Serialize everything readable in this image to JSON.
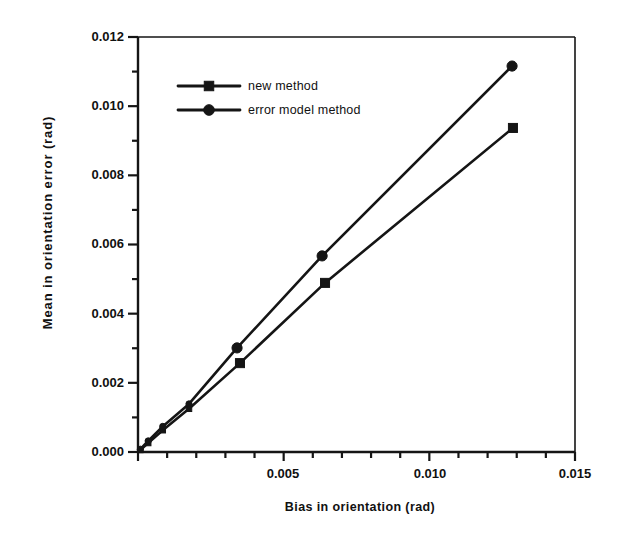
{
  "chart_data": {
    "type": "line",
    "title": "",
    "xlabel": "Bias in orientation (rad)",
    "ylabel": "Mean  in  orientation  error   (rad)",
    "xlim": [
      0.0,
      0.015
    ],
    "ylim": [
      0.0,
      0.012
    ],
    "xticks": [
      0.0,
      0.005,
      0.01,
      0.015
    ],
    "xtick_labels": [
      "",
      "0.005",
      "0.010",
      "0.015"
    ],
    "yticks": [
      0.0,
      0.002,
      0.004,
      0.006,
      0.008,
      0.01,
      0.012
    ],
    "ytick_labels": [
      "0.000",
      "0.002",
      "0.004",
      "0.006",
      "0.008",
      "0.010",
      "0.012"
    ],
    "minor_tick_step_x": 0.001,
    "minor_tick_step_y": 0.001,
    "grid": false,
    "legend_position": "upper left",
    "line_color": "#151515",
    "series": [
      {
        "name": "new method",
        "marker": "square",
        "x": [
          8e-05,
          0.00035,
          0.00085,
          0.00175,
          0.0035,
          0.00642,
          0.01287
        ],
        "y": [
          6e-05,
          0.00026,
          0.00063,
          0.00125,
          0.00257,
          0.00489,
          0.00937
        ]
      },
      {
        "name": "error model method",
        "marker": "circle",
        "x": [
          8e-05,
          0.00035,
          0.00085,
          0.00175,
          0.0034,
          0.00632,
          0.01284
        ],
        "y": [
          8e-05,
          0.00032,
          0.00074,
          0.00139,
          0.00301,
          0.00567,
          0.01116
        ]
      }
    ]
  },
  "legend": {
    "items": [
      {
        "label": "new method",
        "marker": "square"
      },
      {
        "label": "error model method",
        "marker": "circle"
      }
    ]
  }
}
